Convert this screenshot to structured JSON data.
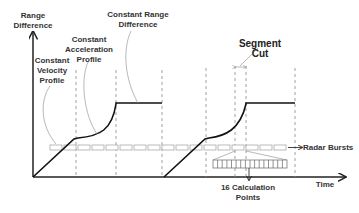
{
  "diagram": {
    "y_axis_label": "Range\nDifference",
    "x_axis_label": "Time",
    "annotations": {
      "constant_velocity": "Constant\nVelocity\nProfile",
      "constant_acceleration": "Constant\nAcceleration\nProfile",
      "constant_range": "Constant Range\nDifference",
      "segment_cut": "Segment Cut",
      "radar_bursts": "Radar Bursts",
      "calc_points": "16 Calculation\nPoints"
    },
    "calc_points_count": 16,
    "colors": {
      "axis": "#222222",
      "profile_line": "#111111",
      "dashed": "#888888",
      "burst": "#aaaaaa",
      "leader": "#999999"
    }
  }
}
